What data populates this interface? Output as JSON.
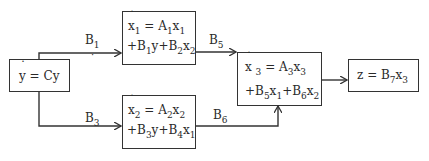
{
  "diagram": {
    "title": "",
    "blocks": {
      "y": {
        "var": "y",
        "rhs": "Cy",
        "eq": "ẏ = Cy"
      },
      "x1": {
        "var": "x",
        "sub": "1",
        "line1_rhs": "A",
        "a_sub": "1",
        "line2": [
          "B",
          "1",
          "y",
          "B",
          "2",
          "x",
          "2"
        ],
        "eq": "ẋ1 = A1x1 + B1y + B2x2"
      },
      "x2": {
        "var": "x",
        "sub": "2",
        "eq": "ẋ2 = A2x2 + B3y + B4x1"
      },
      "x3": {
        "var": "x",
        "sub": "3",
        "eq": "ẋ3 = A3x3 + B5x1 + B6x2"
      },
      "z": {
        "eq": "z = B7x3"
      }
    },
    "edges": [
      {
        "from": "y",
        "to": "x1",
        "label": "B1",
        "label_main": "B",
        "label_sub": "1"
      },
      {
        "from": "y",
        "to": "x2",
        "label": "B3",
        "label_main": "B",
        "label_sub": "3"
      },
      {
        "from": "x1",
        "to": "x3",
        "label": "B5",
        "label_main": "B",
        "label_sub": "5"
      },
      {
        "from": "x2",
        "to": "x3",
        "label": "B6",
        "label_main": "B",
        "label_sub": "6"
      },
      {
        "from": "x3",
        "to": "z",
        "label": "",
        "label_main": "",
        "label_sub": ""
      }
    ],
    "colors": {
      "line": "#333333",
      "text": "#2a2a2a",
      "background": "#ffffff"
    }
  }
}
